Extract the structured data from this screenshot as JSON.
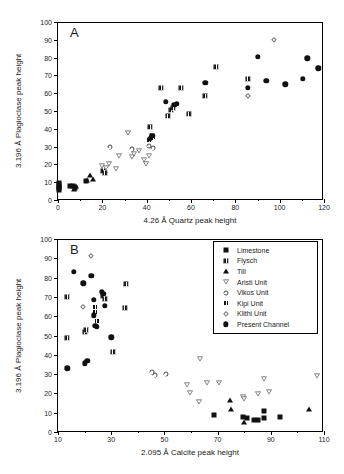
{
  "figure": {
    "panels": [
      {
        "letter": "A",
        "xlabel": "4.26  Å Quartz peak height",
        "ylabel": "3.196 Å Plagioclase peak height",
        "xticks": [
          "0",
          "20",
          "40",
          "60",
          "80",
          "100",
          "120"
        ],
        "yticks": [
          "0",
          "10",
          "20",
          "30",
          "40",
          "50",
          "60",
          "70",
          "80",
          "90",
          "100"
        ]
      },
      {
        "letter": "B",
        "xlabel": "2.095 Å Calcite peak height",
        "ylabel": "3.196 Å Plagioclase peak height",
        "xticks": [
          "10",
          "30",
          "50",
          "70",
          "90",
          "110"
        ],
        "yticks": [
          "0",
          "10",
          "20",
          "30",
          "40",
          "50",
          "60",
          "70",
          "80",
          "90",
          "100"
        ]
      }
    ],
    "legend": {
      "items": [
        {
          "label": "Limestone",
          "marker": "filled-square"
        },
        {
          "label": "Flysch",
          "marker": "crossed-square"
        },
        {
          "label": "Till",
          "marker": "filled-triangle-up"
        },
        {
          "label": "Aristi Unit",
          "marker": "open-triangle-down"
        },
        {
          "label": "Vikos Unit",
          "marker": "open-circle"
        },
        {
          "label": "Kipi Unit",
          "marker": "crossed-square-small"
        },
        {
          "label": "Klithi Unit",
          "marker": "open-diamond"
        },
        {
          "label": "Present Channel",
          "marker": "filled-circle"
        }
      ]
    }
  },
  "chart_data": [
    {
      "type": "scatter",
      "panel": "A",
      "title": "A",
      "xlabel": "4.26  Å Quartz peak height",
      "ylabel": "3.196 Å Plagioclase peak height",
      "xlim": [
        0,
        120
      ],
      "ylim": [
        0,
        100
      ],
      "xticks": [
        0,
        20,
        40,
        60,
        80,
        100,
        120
      ],
      "yticks": [
        0,
        10,
        20,
        30,
        40,
        50,
        60,
        70,
        80,
        90,
        100
      ],
      "grid": false,
      "legend_position": "none",
      "series": [
        {
          "name": "Limestone",
          "marker": "filled-square",
          "points": [
            [
              0.3,
              6.5
            ],
            [
              0.3,
              7.5
            ],
            [
              0.4,
              8.6
            ],
            [
              0.4,
              9.6
            ],
            [
              0.5,
              5.8
            ],
            [
              5.5,
              7.6
            ],
            [
              6.8,
              8.0
            ],
            [
              7.5,
              7.0
            ],
            [
              12.5,
              10.6
            ]
          ]
        },
        {
          "name": "Flysch",
          "marker": "crossed-square",
          "points": [
            [
              20.5,
              16.5
            ],
            [
              21.0,
              15.2
            ],
            [
              41.5,
              40.8
            ],
            [
              42.5,
              36.0
            ],
            [
              46.5,
              63.2
            ],
            [
              49.5,
              47.0
            ],
            [
              51.0,
              50.5
            ],
            [
              52.0,
              51.5
            ],
            [
              55.5,
              63.2
            ],
            [
              59.0,
              48.2
            ],
            [
              66.5,
              58.2
            ],
            [
              71.5,
              75.0
            ],
            [
              85.5,
              68.2
            ]
          ]
        },
        {
          "name": "Till",
          "marker": "filled-triangle-up",
          "points": [
            [
              7.0,
              6.0
            ],
            [
              8.0,
              7.8
            ],
            [
              13.0,
              11.0
            ],
            [
              14.5,
              14.0
            ],
            [
              16.0,
              12.0
            ]
          ]
        },
        {
          "name": "Aristi Unit",
          "marker": "open-triangle-down",
          "points": [
            [
              20.0,
              19.0
            ],
            [
              21.5,
              18.0
            ],
            [
              23.0,
              20.0
            ],
            [
              26.0,
              17.5
            ],
            [
              27.5,
              24.5
            ],
            [
              31.5,
              37.5
            ],
            [
              33.5,
              24.0
            ],
            [
              34.5,
              26.0
            ],
            [
              36.5,
              27.5
            ],
            [
              39.0,
              22.5
            ],
            [
              39.5,
              20.0
            ],
            [
              41.0,
              25.0
            ]
          ]
        },
        {
          "name": "Vikos Unit",
          "marker": "open-circle",
          "points": [
            [
              23.5,
              29.5
            ],
            [
              33.5,
              28.5
            ],
            [
              41.0,
              30.5
            ],
            [
              43.0,
              29.0
            ]
          ]
        },
        {
          "name": "Kipi Unit",
          "marker": "crossed-square-small",
          "points": [
            [
              41.0,
              33.5
            ],
            [
              42.0,
              35.0
            ],
            [
              43.0,
              35.5
            ]
          ]
        },
        {
          "name": "Klithi Unit",
          "marker": "open-diamond",
          "points": [
            [
              97.5,
              90.0
            ],
            [
              85.5,
              58.5
            ]
          ]
        },
        {
          "name": "Present Channel",
          "marker": "filled-circle",
          "points": [
            [
              41.5,
              34.5
            ],
            [
              42.5,
              36.0
            ],
            [
              48.5,
              55.0
            ],
            [
              52.5,
              53.5
            ],
            [
              53.5,
              54.0
            ],
            [
              66.5,
              66.0
            ],
            [
              85.5,
              63.0
            ],
            [
              90.0,
              80.5
            ],
            [
              94.0,
              67.0
            ],
            [
              102.5,
              65.0
            ],
            [
              110.5,
              68.0
            ],
            [
              112.5,
              79.5
            ],
            [
              117.5,
              74.0
            ]
          ]
        }
      ]
    },
    {
      "type": "scatter",
      "panel": "B",
      "title": "B",
      "xlabel": "2.095 Å Calcite peak height",
      "ylabel": "3.196 Å Plagioclase peak height",
      "xlim": [
        10,
        110
      ],
      "ylim": [
        0,
        100
      ],
      "xticks": [
        10,
        30,
        50,
        70,
        90,
        110
      ],
      "yticks": [
        0,
        10,
        20,
        30,
        40,
        50,
        60,
        70,
        80,
        90,
        100
      ],
      "grid": false,
      "legend_position": "upper-right",
      "series": [
        {
          "name": "Limestone",
          "marker": "filled-square",
          "points": [
            [
              68.5,
              9.0
            ],
            [
              79.5,
              8.0
            ],
            [
              81.0,
              7.5
            ],
            [
              83.5,
              6.0
            ],
            [
              85.0,
              6.0
            ],
            [
              87.5,
              7.0
            ],
            [
              87.5,
              11.0
            ],
            [
              93.5,
              8.0
            ]
          ]
        },
        {
          "name": "Flysch",
          "marker": "crossed-square",
          "points": [
            [
              13.5,
              70.0
            ],
            [
              13.5,
              48.5
            ],
            [
              20.0,
              52.0
            ],
            [
              20.5,
              53.0
            ],
            [
              27.0,
              70.5
            ],
            [
              27.5,
              69.0
            ],
            [
              30.5,
              41.5
            ],
            [
              35.5,
              76.5
            ],
            [
              35.0,
              64.5
            ]
          ]
        },
        {
          "name": "Till",
          "marker": "filled-triangle-up",
          "points": [
            [
              74.5,
              16.5
            ],
            [
              75.0,
              12.0
            ],
            [
              80.0,
              5.0
            ],
            [
              104.5,
              12.0
            ]
          ]
        },
        {
          "name": "Aristi Unit",
          "marker": "open-triangle-down",
          "points": [
            [
              58.5,
              24.5
            ],
            [
              59.5,
              20.0
            ],
            [
              63.0,
              15.5
            ],
            [
              63.5,
              38.0
            ],
            [
              66.0,
              25.5
            ],
            [
              70.5,
              25.5
            ],
            [
              79.5,
              18.0
            ],
            [
              80.0,
              17.0
            ],
            [
              85.0,
              19.5
            ],
            [
              87.5,
              27.5
            ],
            [
              89.5,
              20.5
            ],
            [
              107.5,
              29.0
            ]
          ]
        },
        {
          "name": "Vikos Unit",
          "marker": "open-circle",
          "points": [
            [
              45.5,
              31.0
            ],
            [
              46.5,
              29.5
            ],
            [
              50.5,
              30.0
            ]
          ]
        },
        {
          "name": "Kipi Unit",
          "marker": "crossed-square-small",
          "points": [
            [
              24.0,
              65.0
            ],
            [
              24.0,
              62.0
            ],
            [
              24.5,
              57.5
            ]
          ]
        },
        {
          "name": "Klithi Unit",
          "marker": "open-diamond",
          "points": [
            [
              22.5,
              91.0
            ],
            [
              19.5,
              65.0
            ]
          ]
        },
        {
          "name": "Present Channel",
          "marker": "filled-circle",
          "points": [
            [
              16.0,
              83.0
            ],
            [
              19.5,
              77.0
            ],
            [
              22.5,
              81.0
            ],
            [
              26.5,
              72.5
            ],
            [
              27.0,
              71.5
            ],
            [
              27.5,
              65.5
            ],
            [
              30.0,
              49.0
            ],
            [
              13.5,
              33.0
            ],
            [
              20.0,
              35.5
            ],
            [
              21.0,
              37.0
            ],
            [
              23.5,
              68.5
            ],
            [
              23.5,
              60.5
            ],
            [
              24.0,
              55.0
            ],
            [
              24.5,
              54.5
            ]
          ]
        }
      ]
    }
  ]
}
